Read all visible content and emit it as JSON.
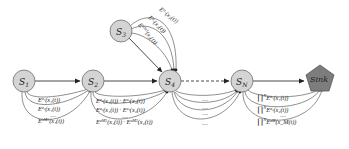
{
  "diagram": {
    "nodes": [
      {
        "id": "S1",
        "label": "S",
        "sub": "1"
      },
      {
        "id": "S2",
        "label": "S",
        "sub": "2"
      },
      {
        "id": "S3",
        "label": "S",
        "sub": "3"
      },
      {
        "id": "S4",
        "label": "S",
        "sub": "4"
      },
      {
        "id": "SN",
        "label": "S",
        "sub": "N"
      },
      {
        "id": "Sink",
        "label": "Sink"
      }
    ],
    "colors": {
      "node_fill": "#d4d4d4",
      "node_stroke": "#6f6f6f",
      "sink_fill": "#7d7d7d",
      "edge": "#333333"
    },
    "edges": {
      "S1_to_S2": [
        "E^{a_1}(x_1(t))",
        "E^{a_2}(x_1(t))",
        "...",
        "E^{a_{M1}}(x_1(t))"
      ],
      "S2_to_S4": [
        "E^{a_1}(x_1(t)) · E^{a_2}(x_2(t))",
        "E^{a_3}(x_1(t)) · E^{a_4}(x_2(t))",
        "...",
        "E^{a_{M1}}(x_1(t)) · E^{a_{M2}}(x_2(t))"
      ],
      "S3_to_S4": [
        "E^{a_1}(x_3(t))",
        "E^{a_2}(x_3(t))",
        "E^{a_{M3}}(x_3(t))"
      ],
      "S4_to_SN": [
        "...",
        "...",
        "...",
        "..."
      ],
      "SN_to_Sink": [
        "∏_{i=1}^{N} E^{a_1}(x_1(t))",
        "∏_{i=1}^{N} E^{a_2}(x_2(t))",
        "...",
        "∏_{i=1}^{N} E^{a_M}(x_M(t))"
      ]
    },
    "labels": {
      "s1": {
        "e1": "E",
        "s1": "a₁",
        "r1": "(x₁(t))",
        "e2": "E",
        "s2": "a₂",
        "r2": "(x₁(t))",
        "dots": "…",
        "e3": "E",
        "s3": "aM1",
        "r3": "(x₁(t))"
      },
      "s2": {
        "l1": "E",
        "l1s": "a₁",
        "l1r": "(x₁(t)) · E",
        "l1s2": "a₂",
        "l1r2": "(x₂(t))",
        "l2": "E",
        "l2s": "a₃",
        "l2r": "(x₁(t)) · E",
        "l2s2": "a₄",
        "l2r2": "(x₂(t))",
        "dots": "…",
        "l3": "E",
        "l3s": "aM1",
        "l3r": "(x₁(t)) · E",
        "l3s2": "aM2",
        "l3r2": "(x₂(t))"
      },
      "s3": {
        "l1": "E",
        "l1s": "a₁",
        "l1r": "(x₃(t))",
        "l2": "E",
        "l2s": "a₂",
        "l2r": "(x₃(t))",
        "l3": "E",
        "l3s": "aM3",
        "l3r": "(x₃(t))"
      },
      "s4": {
        "d": "…"
      },
      "sn": {
        "p": "∏",
        "lim": "N",
        "low": "i=1",
        "l1": "E",
        "l1s": "a₁",
        "l1r": "(x₁(t))",
        "l2": "E",
        "l2s": "a₂",
        "l2r": "(x₂(t))",
        "dots": "…",
        "l3": "E",
        "l3s": "aM",
        "l3r": "(x_M(t))"
      }
    }
  }
}
